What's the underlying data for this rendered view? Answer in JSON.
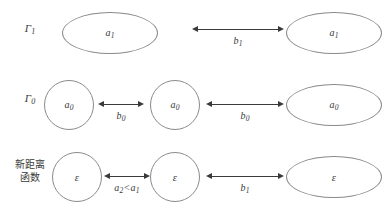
{
  "figure": {
    "rows": [
      {
        "id": "row-gamma-1",
        "label_kind": "math",
        "label_base": "Γ",
        "label_sub": "1",
        "shapes": [
          {
            "name": "shape-left",
            "kind": "ellipse-wide",
            "label_base": "a",
            "label_sub": "1"
          },
          {
            "name": "shape-right",
            "kind": "ellipse-wide",
            "label_base": "a",
            "label_sub": "1"
          }
        ],
        "arrows": [
          {
            "name": "arrow-b1",
            "label_base": "b",
            "label_sub": "1"
          }
        ]
      },
      {
        "id": "row-gamma-0",
        "label_kind": "math",
        "label_base": "Γ",
        "label_sub": "0",
        "shapes": [
          {
            "name": "shape-left",
            "kind": "circle-small",
            "label_base": "a",
            "label_sub": "0"
          },
          {
            "name": "shape-middle",
            "kind": "circle-small",
            "label_base": "a",
            "label_sub": "0"
          },
          {
            "name": "shape-right",
            "kind": "ellipse-wide",
            "label_base": "a",
            "label_sub": "0"
          }
        ],
        "arrows": [
          {
            "name": "arrow-b0-left",
            "label_base": "b",
            "label_sub": "0"
          },
          {
            "name": "arrow-b0-right",
            "label_base": "b",
            "label_sub": "0"
          }
        ]
      },
      {
        "id": "row-new-distance-function",
        "label_kind": "cjk",
        "label_line1": "新距离",
        "label_line2": "函数",
        "shapes": [
          {
            "name": "shape-left",
            "kind": "circle-small",
            "label_base": "ε",
            "label_sub": ""
          },
          {
            "name": "shape-middle",
            "kind": "circle-small",
            "label_base": "ε",
            "label_sub": ""
          },
          {
            "name": "shape-right",
            "kind": "ellipse-wide",
            "label_base": "ε",
            "label_sub": ""
          }
        ],
        "arrows": [
          {
            "name": "arrow-a2-lt-a1",
            "label_base": "a",
            "label_sub": "2",
            "label_tail_base": "<a",
            "label_tail_sub": "1"
          },
          {
            "name": "arrow-b1",
            "label_base": "b",
            "label_sub": "1"
          }
        ]
      }
    ],
    "colors": {
      "stroke": "#8a8a8a",
      "arrow": "#3a3a3a",
      "text": "#3a3a3a",
      "background": "#ffffff"
    }
  }
}
